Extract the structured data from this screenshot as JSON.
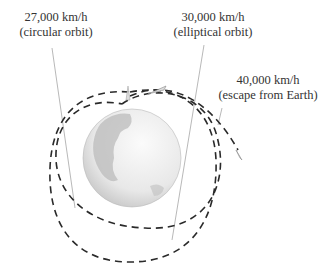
{
  "labels": {
    "circular": {
      "speed": "27,000 km/h",
      "desc": "(circular orbit)"
    },
    "elliptical": {
      "speed": "30,000 km/h",
      "desc": "(elliptical orbit)"
    },
    "escape": {
      "speed": "40,000 km/h",
      "desc": "(escape from Earth)"
    }
  },
  "colors": {
    "orbit": "#2a2a2a",
    "leader": "#888888",
    "earth": "#e6e6e6"
  }
}
